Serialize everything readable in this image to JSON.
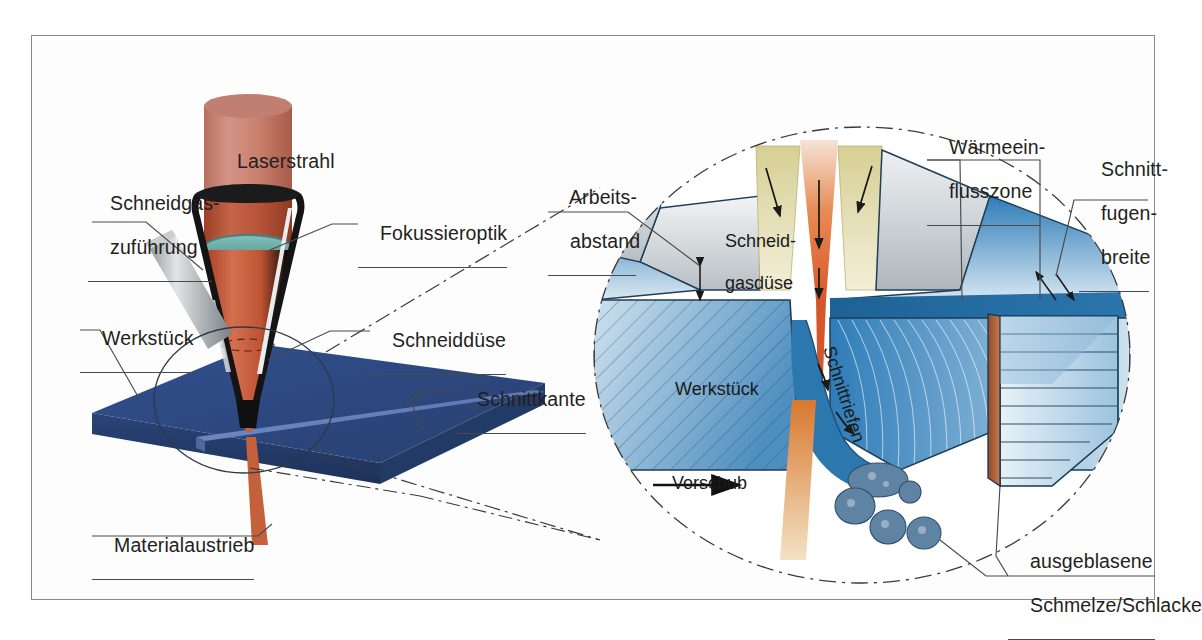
{
  "figure": {
    "background": "#ffffff",
    "frame_border": "#8a8a8a"
  },
  "colors": {
    "laser_beam": "#c4644a",
    "laser_beam_light": "#cf8878",
    "lens_teal": "#6fb3ad",
    "nozzle_black": "#1a1a1a",
    "gas_pipe_grey": "#b9bcbe",
    "workpiece_blue": "#2f4b8f",
    "workpiece_blue_light": "#5d77b5",
    "detail_blue": "#2e7cb8",
    "detail_blue_light": "#bcd7e8",
    "gas_yellow": "#d8d09a",
    "melt_orange": "#e0923f",
    "slag_blue": "#5a7fa0",
    "label_text": "#231f20",
    "leader_line": "#4a4a4a"
  },
  "left_view": {
    "labels": [
      {
        "id": "laserstrahl",
        "text": "Laserstrahl",
        "lines": [
          "Laserstrahl"
        ],
        "x": 215,
        "y": 128,
        "underline": false
      },
      {
        "id": "schneidgas",
        "text": "Schneidgas-\nzuführung",
        "lines": [
          "Schneidgas-",
          "zuführung"
        ],
        "x": 88,
        "y": 170,
        "underline": true
      },
      {
        "id": "fokussieroptik",
        "text": "Fokussieroptik",
        "lines": [
          "Fokussieroptik"
        ],
        "x": 358,
        "y": 212,
        "underline": true
      },
      {
        "id": "werkstueck",
        "text": "Werkstück",
        "lines": [
          "Werkstück"
        ],
        "x": 80,
        "y": 305,
        "underline": true
      },
      {
        "id": "schneiddüse",
        "text": "Schneiddüse",
        "lines": [
          "Schneiddüse"
        ],
        "x": 370,
        "y": 315,
        "underline": true
      },
      {
        "id": "schnittkante",
        "text": "Schnittkante",
        "lines": [
          "Schnittkante"
        ],
        "x": 455,
        "y": 375,
        "underline": true
      },
      {
        "id": "materialaustrieb",
        "text": "Materialaustrieb",
        "lines": [
          "Materialaustrieb"
        ],
        "x": 92,
        "y": 512,
        "underline": true
      }
    ]
  },
  "detail_view": {
    "outer_labels": [
      {
        "id": "arbeitsabstand",
        "lines": [
          "Arbeits-",
          "abstand"
        ],
        "x": 548,
        "y": 164,
        "underline": true
      },
      {
        "id": "waermeeinflusszone",
        "lines": [
          "Wärmeein-",
          "flusszone"
        ],
        "x": 927,
        "y": 114,
        "underline": true
      },
      {
        "id": "schnittfugenbreite",
        "lines": [
          "Schnitt-",
          "fugen-",
          "breite"
        ],
        "x": 1079,
        "y": 136,
        "underline": true
      },
      {
        "id": "ausgeblasene",
        "lines": [
          "ausgeblasene",
          "Schmelze/Schlacke"
        ],
        "x": 1008,
        "y": 528,
        "underline": true
      }
    ],
    "inner_labels": [
      {
        "id": "schneidgasduese",
        "lines": [
          "Schneid-",
          "gasdüse"
        ],
        "x": 705,
        "y": 218,
        "rotation": 0
      },
      {
        "id": "werkstueck-detail",
        "lines": [
          "Werkstück"
        ],
        "x": 655,
        "y": 365,
        "rotation": 0
      },
      {
        "id": "schnittriefen",
        "lines": [
          "Schnittriefen"
        ],
        "x": 843,
        "y": 330,
        "rotation": 72
      },
      {
        "id": "vorschub",
        "lines": [
          "Vorschub"
        ],
        "x": 652,
        "y": 455,
        "rotation": 0
      }
    ],
    "circle": {
      "cx": 862,
      "cy": 355,
      "rx": 268,
      "ry": 228
    },
    "arrows": [
      {
        "id": "gas-arrow-left",
        "label": "gas flow left"
      },
      {
        "id": "gas-arrow-right",
        "label": "gas flow right"
      },
      {
        "id": "beam-arrow-upper",
        "label": "beam down upper"
      },
      {
        "id": "beam-arrow-lower",
        "label": "beam down lower"
      },
      {
        "id": "melt-arrow-upper",
        "label": "melt flow upper"
      },
      {
        "id": "melt-arrow-lower",
        "label": "melt flow lower"
      },
      {
        "id": "vorschub-arrow",
        "label": "feed direction"
      },
      {
        "id": "kerf-arrow-left",
        "label": "kerf width left"
      },
      {
        "id": "kerf-arrow-right",
        "label": "kerf width right"
      },
      {
        "id": "standoff-arrow",
        "label": "standoff distance"
      }
    ]
  }
}
